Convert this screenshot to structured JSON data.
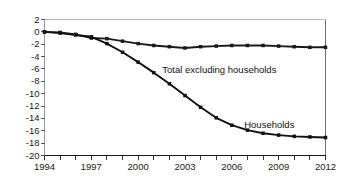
{
  "chart_data": {
    "type": "line",
    "title": "",
    "subtitle": "",
    "xlabel": "",
    "ylabel": "",
    "xlim": [
      1994,
      2012
    ],
    "ylim": [
      -20,
      2
    ],
    "yticks": [
      2,
      0,
      -2,
      -4,
      -6,
      -8,
      -10,
      -12,
      -14,
      -16,
      -18,
      -20
    ],
    "ytick_labels": [
      "2",
      "0",
      "-2",
      "-4",
      "-6",
      "-8",
      "-10",
      "-12",
      "-14",
      "-16",
      "-18",
      "-20"
    ],
    "xticks": [
      1994,
      1995,
      1996,
      1997,
      1998,
      1999,
      2000,
      2001,
      2002,
      2003,
      2004,
      2005,
      2006,
      2007,
      2008,
      2009,
      2010,
      2011,
      2012
    ],
    "xtick_labels_shown": [
      "1994",
      "1997",
      "2000",
      "2003",
      "2006",
      "2009",
      "2012"
    ],
    "xtick_labels_shown_values": [
      1994,
      1997,
      2000,
      2003,
      2006,
      2009,
      2012
    ],
    "grid": false,
    "legend_position": "inline-annotation",
    "x": [
      1994,
      1995,
      1996,
      1997,
      1998,
      1999,
      2000,
      2001,
      2002,
      2003,
      2004,
      2005,
      2006,
      2007,
      2008,
      2009,
      2010,
      2011,
      2012
    ],
    "series": [
      {
        "name": "Total excluding households",
        "color": "#1a1a1a",
        "marker": "square",
        "values": [
          0.0,
          -0.1,
          -0.4,
          -1.0,
          -1.1,
          -1.5,
          -1.9,
          -2.2,
          -2.4,
          -2.6,
          -2.4,
          -2.3,
          -2.2,
          -2.2,
          -2.2,
          -2.3,
          -2.4,
          -2.5,
          -2.5
        ]
      },
      {
        "name": "Households",
        "color": "#111111",
        "marker": "square",
        "values": [
          0.0,
          -0.2,
          -0.5,
          -0.8,
          -1.9,
          -3.3,
          -4.9,
          -6.6,
          -8.4,
          -10.3,
          -12.2,
          -13.9,
          -15.1,
          -15.9,
          -16.4,
          -16.7,
          -16.9,
          -17.0,
          -17.1
        ]
      }
    ],
    "annotations": [
      {
        "text": "Total excluding households",
        "x_value": 2005.2,
        "y_value": -6.2
      },
      {
        "text": "Households",
        "x_value": 2008.4,
        "y_value": -15.0
      }
    ]
  }
}
